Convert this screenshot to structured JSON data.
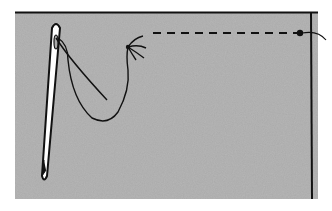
{
  "illustration": {
    "title": "Needle and thread on fabric with running stitch",
    "subjects": [
      "fabric-swatch",
      "sewing-needle",
      "thread-loop",
      "running-stitch",
      "knot"
    ],
    "colors": {
      "fabric": "#a9a9a9",
      "fabric_light": "#c2c2c2",
      "fabric_dark": "#8e8e8e",
      "ink": "#111111",
      "background": "#ffffff"
    }
  }
}
